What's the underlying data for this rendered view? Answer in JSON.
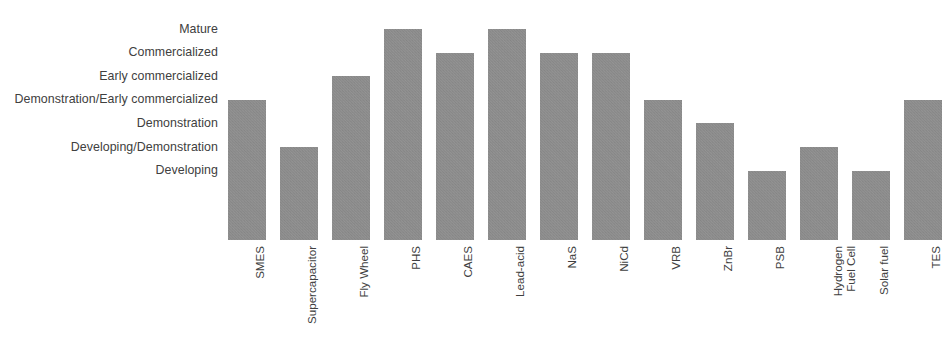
{
  "chart_data": {
    "type": "bar",
    "title": "",
    "subtitle": "",
    "xlabel": "",
    "ylabel": "",
    "grid": false,
    "legend": null,
    "orientation": "vertical",
    "bar_color": "#8d8d8d",
    "y_axis": {
      "type": "ordinal",
      "tick_labels": [
        "Developing",
        "Developing/Demonstration",
        "Demonstration",
        "Demonstration/Early commercialized",
        "Early commercialized",
        "Commercialized",
        "Mature"
      ],
      "tick_values": [
        1,
        2,
        3,
        4,
        5,
        6,
        7
      ],
      "ylim": [
        0,
        7.3
      ]
    },
    "categories": [
      "SMES",
      "Supercapacitor",
      "Fly Wheel",
      "PHS",
      "CAES",
      "Lead-acid",
      "NaS",
      "NiCd",
      "VRB",
      "ZnBr",
      "PSB",
      "Hydrogen Fuel Cell",
      "Solar fuel",
      "TES"
    ],
    "values": [
      4,
      2,
      5,
      7,
      6,
      7,
      6,
      6,
      4,
      3,
      1,
      2,
      1,
      4
    ],
    "value_labels": [
      "Demonstration/Early commercialized",
      "Developing/Demonstration",
      "Early commercialized",
      "Mature",
      "Commercialized",
      "Mature",
      "Commercialized",
      "Commercialized",
      "Demonstration/Early commercialized",
      "Demonstration",
      "Developing",
      "Developing/Demonstration",
      "Developing",
      "Demonstration/Early commercialized"
    ]
  },
  "x_axis_labels": [
    {
      "line1": "SMES",
      "line2": ""
    },
    {
      "line1": "Supercapacitor",
      "line2": ""
    },
    {
      "line1": "Fly Wheel",
      "line2": ""
    },
    {
      "line1": "PHS",
      "line2": ""
    },
    {
      "line1": "CAES",
      "line2": ""
    },
    {
      "line1": "Lead-acid",
      "line2": ""
    },
    {
      "line1": "NaS",
      "line2": ""
    },
    {
      "line1": "NiCd",
      "line2": ""
    },
    {
      "line1": "VRB",
      "line2": ""
    },
    {
      "line1": "ZnBr",
      "line2": ""
    },
    {
      "line1": "PSB",
      "line2": ""
    },
    {
      "line1": "Hydrogen",
      "line2": "Fuel Cell"
    },
    {
      "line1": "Solar fuel",
      "line2": ""
    },
    {
      "line1": "TES",
      "line2": ""
    }
  ]
}
